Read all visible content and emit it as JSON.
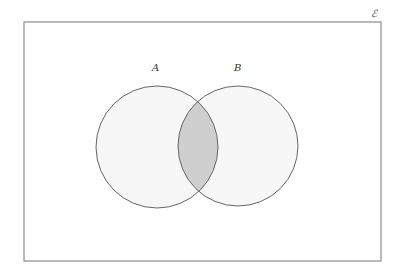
{
  "diagram": {
    "type": "venn",
    "universal_set": {
      "symbol": "ℰ",
      "x": 24,
      "y": 22,
      "width": 357,
      "height": 239,
      "stroke": "#8a8a8a",
      "fill": "#ffffff"
    },
    "sets": [
      {
        "label": "A",
        "cx": 157,
        "cy": 147,
        "r": 61,
        "label_x": 155,
        "label_y": 70,
        "fill": "#f7f7f7",
        "stroke": "#666666"
      },
      {
        "label": "B",
        "cx": 238,
        "cy": 146,
        "r": 60,
        "label_x": 237,
        "label_y": 70,
        "fill": "#f7f7f7",
        "stroke": "#666666"
      }
    ],
    "shaded_region": {
      "description": "A ∩ B",
      "fill": "#cfcfcf"
    }
  }
}
